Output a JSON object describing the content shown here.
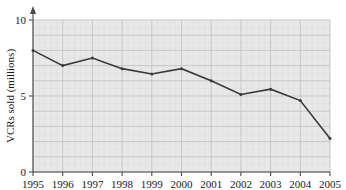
{
  "chart_data": {
    "type": "line",
    "title": "",
    "xlabel": "",
    "ylabel": "VCRs sold (millions)",
    "categories": [
      "1995",
      "1996",
      "1997",
      "1998",
      "1999",
      "2000",
      "2001",
      "2002",
      "2003",
      "2004",
      "2005"
    ],
    "values": [
      8.0,
      7.0,
      7.5,
      6.8,
      6.45,
      6.8,
      6.0,
      5.1,
      5.45,
      4.7,
      2.2
    ],
    "series": [
      {
        "name": "VCRs sold",
        "values": [
          8.0,
          7.0,
          7.5,
          6.8,
          6.45,
          6.8,
          6.0,
          5.1,
          5.45,
          4.7,
          2.2
        ]
      }
    ],
    "ylim": [
      0,
      10
    ],
    "yticks": [
      0,
      5,
      10
    ],
    "ytick_labels": [
      "0",
      "5",
      "10"
    ],
    "xtick_labels": [
      "1995",
      "1996",
      "1997",
      "1998",
      "1999",
      "2000",
      "2001",
      "2002",
      "2003",
      "2004",
      "2005"
    ],
    "grid": true,
    "grid_minor": true,
    "legend": "none",
    "legend_position": "none",
    "y_axis_arrow": true,
    "colors": {
      "line": "#3a3a3a",
      "plot_background": "#e8e8e8",
      "grid_minor": "#dcdcdc",
      "grid_major": "#bfbfbf",
      "axis": "#4a4a4a",
      "text": "#1a1a1a",
      "page_background": "#ffffff"
    }
  }
}
